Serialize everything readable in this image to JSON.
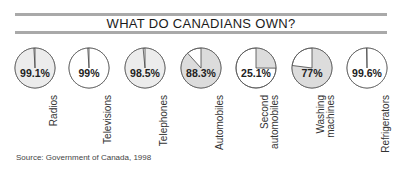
{
  "title": "WHAT DO CANADIANS OWN?",
  "source": "Source: Government of Canada, 1998",
  "colors": {
    "owned_fill": "#dcdcdc",
    "light_fill": "#ececec",
    "outline": "#555555",
    "rule": "#a9a9a9"
  },
  "items": [
    {
      "label": "Radios",
      "value": "99.1%"
    },
    {
      "label": "Televisions",
      "value": "99%"
    },
    {
      "label": "Telephones",
      "value": "98.5%"
    },
    {
      "label": "Automobiles",
      "value": "88.3%"
    },
    {
      "label": "Second automobiles",
      "value": "25.1%"
    },
    {
      "label": "Washing machines",
      "value": "77%"
    },
    {
      "label": "Refrigerators",
      "value": "99.6%"
    }
  ],
  "chart_data": {
    "type": "pie",
    "title": "WHAT DO CANADIANS OWN?",
    "categories": [
      "Radios",
      "Televisions",
      "Telephones",
      "Automobiles",
      "Second automobiles",
      "Washing machines",
      "Refrigerators"
    ],
    "values": [
      99.1,
      99,
      98.5,
      88.3,
      25.1,
      77,
      99.6
    ],
    "unit": "%",
    "note": "Small-multiple pie charts, one per item, shaded portion = % of households owning",
    "source": "Source: Government of Canada, 1998"
  }
}
